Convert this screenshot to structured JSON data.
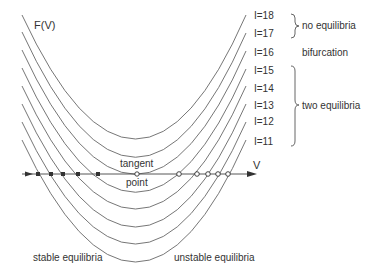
{
  "diagram": {
    "y_axis_label": "F(V)",
    "x_axis_label": "V",
    "tangent_label_top": "tangent",
    "tangent_label_bottom": "point",
    "stable_label": "stable equilibria",
    "unstable_label": "unstable equilibria",
    "curves": [
      {
        "label": "I=18",
        "vertex_y": 139,
        "left_y": 15,
        "right_y": 15
      },
      {
        "label": "I=17",
        "vertex_y": 157,
        "left_y": 32,
        "right_y": 33
      },
      {
        "label": "I=16",
        "vertex_y": 174,
        "left_y": 50,
        "right_y": 51
      },
      {
        "label": "I=15",
        "vertex_y": 192,
        "left_y": 68,
        "right_y": 69
      },
      {
        "label": "I=14",
        "vertex_y": 209,
        "left_y": 86,
        "right_y": 86
      },
      {
        "label": "I=13",
        "vertex_y": 227,
        "left_y": 104,
        "right_y": 104
      },
      {
        "label": "I=12",
        "vertex_y": 244,
        "left_y": 122,
        "right_y": 122
      },
      {
        "label": "I=11",
        "vertex_y": 262,
        "left_y": 140,
        "right_y": 140
      }
    ],
    "groups": [
      {
        "label": "no equilibria",
        "curves": [
          "I=18",
          "I=17"
        ]
      },
      {
        "label": "bifurcation",
        "curves": [
          "I=16"
        ]
      },
      {
        "label": "two equilibria",
        "curves": [
          "I=15",
          "I=14",
          "I=13",
          "I=12",
          "I=11"
        ]
      }
    ],
    "stable_points_x": [
      38,
      51,
      63,
      78,
      98
    ],
    "tangent_point_x": 137,
    "unstable_points_x": [
      178,
      196,
      206,
      216,
      226
    ],
    "colors": {
      "line": "#555555",
      "text": "#333333",
      "marker": "#333333"
    }
  }
}
